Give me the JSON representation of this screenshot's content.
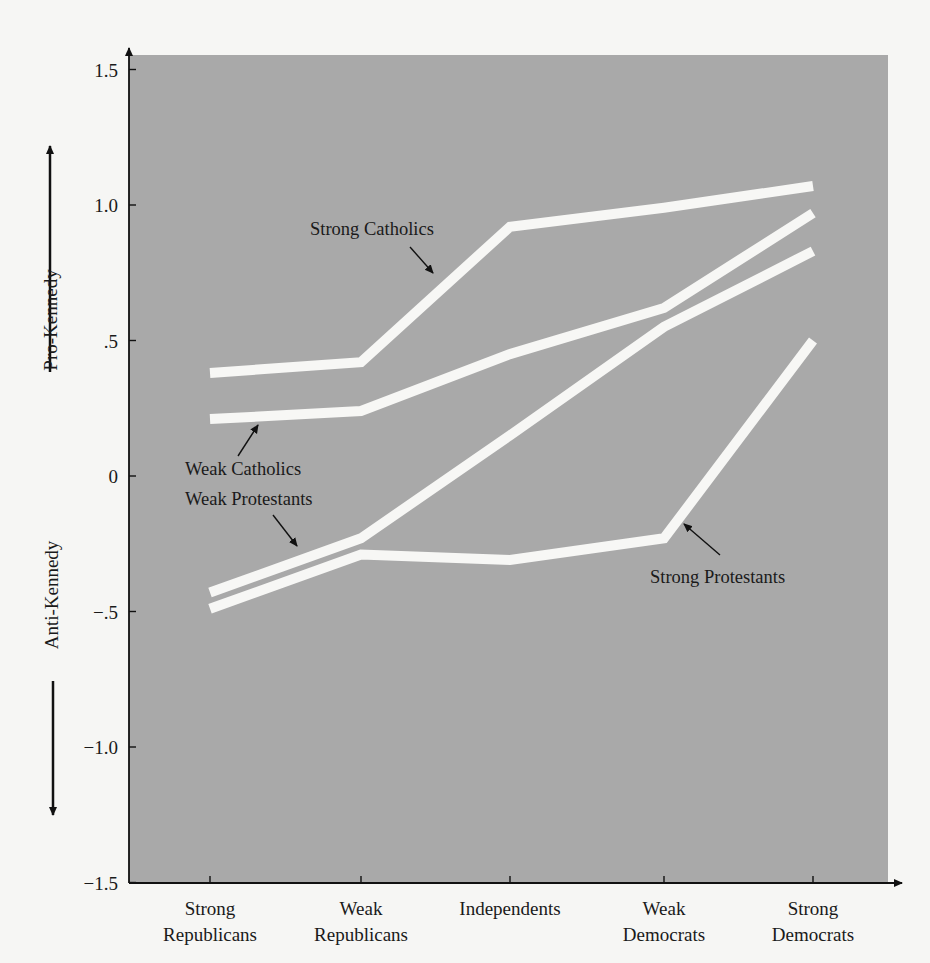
{
  "chart_data": {
    "type": "line",
    "title": "",
    "xlabel": "",
    "ylabel_positive": "Pro-Kennedy",
    "ylabel_negative": "Anti-Kennedy",
    "categories": [
      "Strong Republicans",
      "Weak Republicans",
      "Independents",
      "Weak Democrats",
      "Strong Democrats"
    ],
    "category_lines": [
      [
        "Strong",
        "Republicans"
      ],
      [
        "Weak",
        "Republicans"
      ],
      [
        "Independents"
      ],
      [
        "Weak",
        "Democrats"
      ],
      [
        "Strong",
        "Democrats"
      ]
    ],
    "ylim": [
      -1.5,
      1.5
    ],
    "yticks": [
      1.5,
      1.0,
      0.5,
      0,
      -0.5,
      -1.0,
      -1.5
    ],
    "ytick_labels": [
      "1.5",
      "1.0",
      ".5",
      "0",
      "−.5",
      "−1.0",
      "−1.5"
    ],
    "grid": false,
    "legend": "none (series labeled directly with annotations)",
    "series": [
      {
        "name": "Strong Catholics",
        "values": [
          0.38,
          0.42,
          0.92,
          0.99,
          1.07
        ]
      },
      {
        "name": "Weak Catholics",
        "values": [
          0.21,
          0.24,
          0.45,
          0.62,
          0.97
        ]
      },
      {
        "name": "Weak Protestants",
        "values": [
          -0.43,
          -0.23,
          0.15,
          0.55,
          0.83
        ]
      },
      {
        "name": "Strong Protestants",
        "values": [
          -0.49,
          -0.29,
          -0.31,
          -0.23,
          0.5
        ]
      }
    ],
    "annotations": [
      {
        "text": "Strong Catholics",
        "series": "Strong Catholics"
      },
      {
        "text": "Weak Catholics",
        "series": "Weak Catholics"
      },
      {
        "text": "Weak Protestants",
        "series": "Weak Protestants"
      },
      {
        "text": "Strong Protestants",
        "series": "Strong Protestants"
      }
    ]
  },
  "colors": {
    "page_background": "#f6f6f4",
    "plot_background": "#a9a9a9",
    "line_color": "#f7f7f5",
    "axis_color": "#111111"
  }
}
